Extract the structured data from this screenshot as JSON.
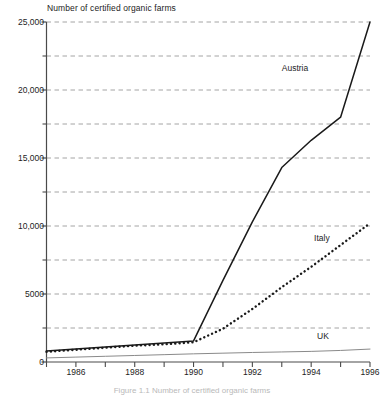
{
  "chart_data": {
    "type": "line",
    "title": "Number of certified organic farms",
    "xlabel": "",
    "ylabel": "",
    "xlim": [
      1985,
      1996
    ],
    "ylim": [
      0,
      25000
    ],
    "grid": true,
    "grid_interval": 2500,
    "legend_position": "inline-labels",
    "x": [
      1985,
      1986,
      1987,
      1988,
      1989,
      1990,
      1991,
      1992,
      1993,
      1994,
      1995,
      1996
    ],
    "y_ticks_major": [
      0,
      5000,
      10000,
      15000,
      20000,
      25000
    ],
    "y_tick_labels": [
      "0",
      "5000",
      "10,000",
      "15,000",
      "20,000",
      "25,000"
    ],
    "y_ticks_minor": [
      2500,
      7500,
      12500,
      17500,
      22500
    ],
    "x_ticks": [
      1985,
      1986,
      1987,
      1988,
      1989,
      1990,
      1991,
      1992,
      1993,
      1994,
      1995,
      1996
    ],
    "x_tick_labels": [
      "",
      "1986",
      "",
      "1988",
      "",
      "1990",
      "",
      "1992",
      "",
      "1994",
      "",
      "1996"
    ],
    "series": [
      {
        "name": "Austria",
        "style": "solid",
        "color": "#1a1a1a",
        "values": [
          800,
          950,
          1100,
          1250,
          1400,
          1550,
          6000,
          10300,
          14300,
          16300,
          18000,
          25000
        ]
      },
      {
        "name": "Italy",
        "style": "dotted",
        "color": "#1a1a1a",
        "values": [
          750,
          900,
          1050,
          1200,
          1300,
          1450,
          2450,
          3900,
          5500,
          7000,
          8600,
          10200
        ]
      },
      {
        "name": "UK",
        "style": "solid-thin",
        "color": "#8a8a8a",
        "values": [
          300,
          360,
          420,
          480,
          540,
          600,
          650,
          700,
          740,
          780,
          850,
          950
        ]
      }
    ],
    "annotations": [
      {
        "text": "Austria",
        "x": 1993.0,
        "y": 21600
      },
      {
        "text": "Italy",
        "x": 1994.1,
        "y": 9050
      },
      {
        "text": "UK",
        "x": 1994.2,
        "y": 1900
      }
    ]
  },
  "caption": {
    "text": "Figure 1.1 Number of certified organic farms"
  },
  "colors": {
    "axis": "#4a4a4a",
    "grid": "#9a9a9a",
    "text": "#1d1d1d",
    "uk_line": "#8a8a8a",
    "main_line": "#1a1a1a"
  }
}
